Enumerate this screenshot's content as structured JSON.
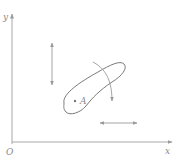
{
  "diagram": {
    "axes": {
      "y_label": "y",
      "x_label": "x",
      "origin_label": "O"
    },
    "region": {
      "point_label": "A"
    },
    "arrows": [
      {
        "name": "vertical-double-arrow",
        "type": "double-headed",
        "orientation": "vertical"
      },
      {
        "name": "curved-arrow",
        "type": "single-headed",
        "orientation": "curved-downward"
      },
      {
        "name": "horizontal-double-arrow",
        "type": "double-headed",
        "orientation": "horizontal"
      }
    ],
    "colors": {
      "stroke": "#9a9a9a",
      "region_stroke": "#7a7a7a",
      "text": "#8a8a8a",
      "background": "#ffffff"
    }
  }
}
